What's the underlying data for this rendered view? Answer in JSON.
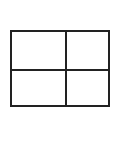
{
  "diagram": {
    "type": "grid",
    "rows": 2,
    "columns": 2,
    "line_color": "#222222",
    "background_color": "#ffffff",
    "cells": [
      {
        "row": 0,
        "col": 0,
        "label": ""
      },
      {
        "row": 0,
        "col": 1,
        "label": ""
      },
      {
        "row": 1,
        "col": 0,
        "label": ""
      },
      {
        "row": 1,
        "col": 1,
        "label": ""
      }
    ]
  }
}
